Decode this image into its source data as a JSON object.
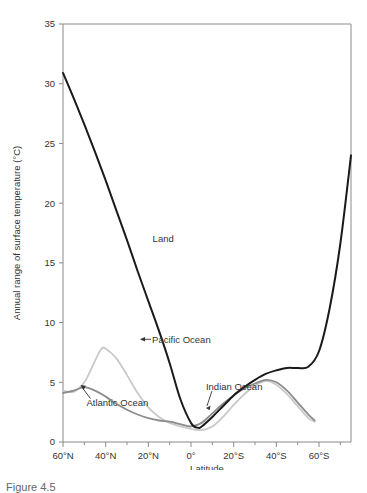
{
  "figure": {
    "caption_fragment": "Figure 4.5"
  },
  "chart_data": {
    "type": "line",
    "title": "",
    "xlabel": "Latitude",
    "ylabel": "Annual range of surface temperature (°C)",
    "ylim": [
      0,
      35
    ],
    "yticks": [
      0,
      5,
      10,
      15,
      20,
      25,
      30,
      35
    ],
    "ytick_labels": [
      "0",
      "5",
      "10",
      "15",
      "20",
      "25",
      "30",
      "35"
    ],
    "xlim_deg": [
      60,
      -75
    ],
    "xticks_deg": [
      60,
      40,
      20,
      0,
      -20,
      -40,
      -60
    ],
    "xtick_labels": [
      "60°N",
      "40°N",
      "20°N",
      "0°",
      "20°S",
      "40°S",
      "60°S"
    ],
    "xminor_step_deg": 10,
    "grid": false,
    "legend_position": "inline-annotations",
    "series": [
      {
        "name": "Land",
        "color": "#1a1a1a",
        "width": 2.0,
        "x": [
          60,
          55,
          50,
          45,
          40,
          35,
          30,
          25,
          20,
          15,
          10,
          5,
          0,
          -3,
          -5,
          -10,
          -15,
          -20,
          -25,
          -30,
          -35,
          -40,
          -45,
          -50,
          -55,
          -60,
          -65,
          -70,
          -75
        ],
        "y": [
          30.9,
          28.8,
          26.6,
          24.3,
          21.9,
          19.4,
          16.9,
          14.3,
          11.8,
          9.3,
          6.6,
          3.6,
          1.6,
          1.2,
          1.3,
          2.1,
          3.0,
          3.9,
          4.6,
          5.2,
          5.7,
          6.0,
          6.2,
          6.2,
          6.3,
          7.6,
          11.2,
          16.6,
          24.0
        ]
      },
      {
        "name": "Pacific Ocean",
        "color": "#8c8c8c",
        "width": 1.8,
        "x": [
          60,
          55,
          50,
          45,
          40,
          35,
          30,
          25,
          20,
          15,
          10,
          5,
          0,
          -5,
          -10,
          -15,
          -20,
          -25,
          -30,
          -35,
          -40,
          -45,
          -50,
          -55,
          -58
        ],
        "y": [
          4.1,
          4.3,
          4.6,
          4.3,
          3.8,
          3.2,
          2.7,
          2.3,
          2.0,
          1.8,
          1.7,
          1.5,
          1.3,
          1.6,
          2.4,
          3.2,
          3.9,
          4.5,
          4.9,
          5.2,
          5.0,
          4.3,
          3.3,
          2.3,
          1.8
        ]
      },
      {
        "name": "Atlantic Ocean",
        "color": "#c9c9c9",
        "width": 1.8,
        "x": [
          60,
          55,
          50,
          45,
          42,
          40,
          35,
          30,
          25,
          20,
          15,
          10,
          5,
          0,
          -5,
          -10,
          -15,
          -20,
          -25,
          -30,
          -35,
          -40,
          -45,
          -50,
          -55,
          -58
        ],
        "y": [
          4.3,
          4.2,
          5.0,
          6.8,
          7.8,
          7.8,
          7.0,
          5.6,
          4.1,
          2.9,
          2.1,
          1.6,
          1.3,
          1.1,
          1.0,
          1.3,
          2.1,
          3.1,
          4.0,
          4.7,
          5.1,
          4.8,
          4.0,
          3.0,
          2.0,
          1.7
        ]
      }
    ],
    "annotations": [
      {
        "name": "land-label",
        "text": "Land",
        "x_deg": 18,
        "y_val": 17.0,
        "arrow": "none"
      },
      {
        "name": "pacific-ocean-label",
        "text": "Pacific Ocean",
        "x_deg": 22,
        "y_val": 8.6,
        "arrow": "left"
      },
      {
        "name": "atlantic-ocean-label",
        "text": "Atlantic Ocean",
        "x_deg": 49,
        "y_val": 3.3,
        "arrow": "up-left"
      },
      {
        "name": "indian-ocean-label",
        "text": "Indian Ocean",
        "x_deg": -7,
        "y_val": 4.6,
        "arrow": "down-left"
      }
    ]
  }
}
